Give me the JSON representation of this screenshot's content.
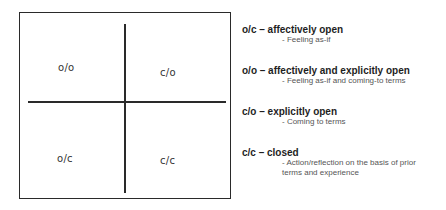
{
  "diagram": {
    "quadrants": [
      {
        "id": "top-left",
        "label": "o/o"
      },
      {
        "id": "top-right",
        "label": "c/o"
      },
      {
        "id": "bottom-left",
        "label": "o/c"
      },
      {
        "id": "bottom-right",
        "label": "c/c"
      }
    ]
  },
  "legend": {
    "items": [
      {
        "title": "o/c – affectively open",
        "description": "- Feeling as-if"
      },
      {
        "title": "o/o – affectively and explicitly open",
        "description": "- Feeling as-if and coming-to terms"
      },
      {
        "title": "c/o – explicitly open",
        "description": "- Coming to terms"
      },
      {
        "title": "c/c – closed",
        "description": "- Action/reflection on the basis of prior\n  terms and experience"
      }
    ]
  }
}
